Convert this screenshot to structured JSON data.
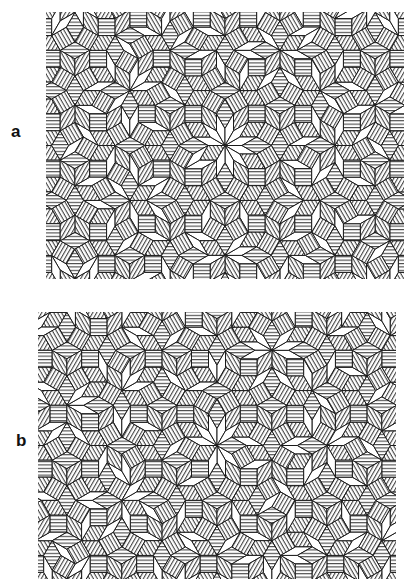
{
  "figure": {
    "panels": [
      {
        "id": "a",
        "label": "a",
        "description": "Dodecagonal quasiperiodic tiling of hatched squares, hatched 60-degree rhombi and white thin 30-degree rhombi",
        "seed_offset": 0.21
      },
      {
        "id": "b",
        "label": "b",
        "description": "Second dodecagonal quasiperiodic tiling variant with the same tile set",
        "seed_offset": 0.37
      }
    ],
    "tile_types": [
      {
        "name": "square",
        "fill": "hatched"
      },
      {
        "name": "rhombus-60",
        "fill": "hatched"
      },
      {
        "name": "rhombus-30",
        "fill": "white"
      }
    ],
    "hatch_directions_deg": [
      0,
      60,
      -60
    ],
    "symmetry": "12-fold",
    "colors": {
      "line": "#1a1a1a",
      "background": "#ffffff",
      "white_tile": "#ffffff"
    }
  }
}
